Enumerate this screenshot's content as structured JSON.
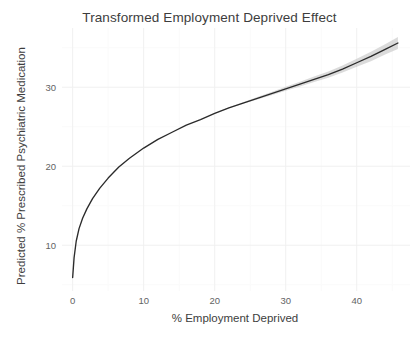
{
  "chart_data": {
    "type": "line",
    "title": "Transformed Employment Deprived Effect",
    "xlabel": "% Employment Deprived",
    "ylabel": "Predicted % Prescribed Psychiatric Medication",
    "xlim": [
      -1.5,
      47.5
    ],
    "ylim": [
      4.2,
      37.5
    ],
    "xticks": [
      0,
      10,
      20,
      30,
      40
    ],
    "xtick_labels": [
      "0",
      "10",
      "20",
      "30",
      "40"
    ],
    "yticks": [
      10,
      20,
      30
    ],
    "ytick_labels": [
      "10",
      "20",
      "30"
    ],
    "grid": true,
    "legend": "none",
    "line_color": "#2b2b2b",
    "ribbon_color": "#bdbdbd",
    "grid_color": "#f0f0f0",
    "panel_background": "#ffffff",
    "series": [
      {
        "name": "Predicted % Prescribed Psychiatric Medication",
        "x": [
          0.0,
          0.2,
          0.5,
          0.9,
          1.4,
          2.0,
          2.8,
          3.8,
          5.0,
          6.5,
          8.0,
          10.0,
          12.0,
          14.0,
          16.0,
          18.0,
          20.0,
          22.0,
          24.0,
          26.0,
          28.0,
          30.0,
          32.0,
          34.0,
          36.0,
          38.0,
          40.0,
          42.0,
          44.0,
          45.8
        ],
        "y": [
          5.9,
          8.4,
          10.5,
          12.1,
          13.4,
          14.6,
          15.9,
          17.2,
          18.5,
          19.9,
          21.0,
          22.3,
          23.4,
          24.3,
          25.2,
          25.9,
          26.7,
          27.4,
          28.0,
          28.6,
          29.2,
          29.8,
          30.4,
          31.0,
          31.6,
          32.3,
          33.1,
          33.9,
          34.8,
          35.6
        ],
        "ci_lower": [
          5.9,
          8.4,
          10.5,
          12.1,
          13.4,
          14.6,
          15.9,
          17.2,
          18.5,
          19.9,
          21.0,
          22.3,
          23.4,
          24.3,
          25.2,
          25.9,
          26.65,
          27.35,
          27.9,
          28.45,
          29.0,
          29.55,
          30.1,
          30.65,
          31.2,
          31.85,
          32.6,
          33.3,
          34.15,
          34.85
        ],
        "ci_upper": [
          5.9,
          8.4,
          10.5,
          12.1,
          13.4,
          14.6,
          15.9,
          17.2,
          18.5,
          19.9,
          21.0,
          22.3,
          23.4,
          24.3,
          25.2,
          25.9,
          26.75,
          27.45,
          28.1,
          28.75,
          29.4,
          30.05,
          30.7,
          31.35,
          32.0,
          32.75,
          33.6,
          34.5,
          35.45,
          36.35
        ]
      }
    ]
  }
}
